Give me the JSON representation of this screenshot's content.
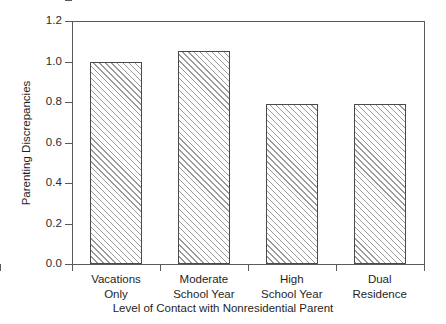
{
  "chart_data": {
    "type": "bar",
    "title": "",
    "xlabel": "Level of Contact with Nonresidential Parent",
    "ylabel": "Parenting Discrepancies",
    "categories": [
      "Vacations Only",
      "Moderate School Year",
      "High School Year",
      "Dual Residence"
    ],
    "category_lines": [
      [
        "Vacations",
        "Only"
      ],
      [
        "Moderate",
        "School Year"
      ],
      [
        "High",
        "School Year"
      ],
      [
        "Dual",
        "Residence"
      ]
    ],
    "values": [
      1.0,
      1.05,
      0.79,
      0.79
    ],
    "ylim": [
      0.0,
      1.2
    ],
    "ytick_labels": [
      "1.2",
      "1.0",
      "0.8",
      "0.6",
      "0.4",
      "0.2",
      "0.0"
    ],
    "ytick_values": [
      1.2,
      1.0,
      0.8,
      0.6,
      0.4,
      0.2,
      0.0
    ],
    "grid": false,
    "legend": null,
    "bar_fill": "hatched-diagonal",
    "bar_edge_color": "#4a4a4a",
    "hatch_color": "#9a9a9a",
    "axis_color": "#5a5a5a",
    "text_color": "#1f1f1f",
    "background": "#ffffff"
  }
}
